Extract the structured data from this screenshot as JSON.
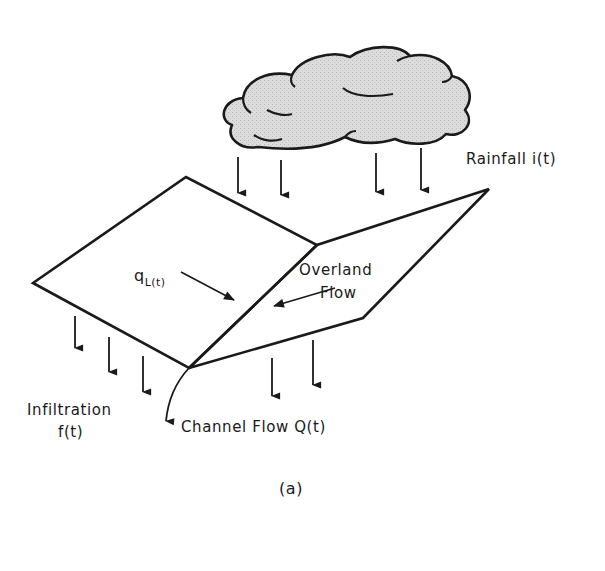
{
  "figure": {
    "caption": "(a)",
    "colors": {
      "ink": "#1a1a1a",
      "cloud_fill": "#d9d9d9",
      "background": "#ffffff"
    }
  },
  "labels": {
    "rainfall": "Rainfall i(t)",
    "lateral_inflow_symbol": "q",
    "lateral_inflow_subscript": "L(t)",
    "overland_line1": "Overland",
    "overland_line2": "Flow",
    "infiltration_line1": "Infiltration",
    "infiltration_line2_f": "f",
    "infiltration_line2_rest": "(t)",
    "channel_flow": "Channel Flow Q(t)"
  },
  "elements": {
    "cloud": "rain-cloud",
    "rain_arrows": 4,
    "infiltration_arrows_left_plane": 3,
    "infiltration_arrows_right_plane": 2,
    "planes": [
      "left-overland-plane",
      "right-overland-plane"
    ],
    "channel": "v-channel-at-plane-junction"
  }
}
